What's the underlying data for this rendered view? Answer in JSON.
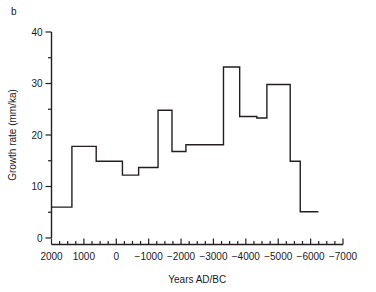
{
  "figure": {
    "panel_label": "b",
    "background_color": "#ffffff",
    "line_color": "#231f20",
    "axis_color": "#231f20"
  },
  "chart_data": {
    "type": "line",
    "style": "step-post",
    "title": "",
    "subtitle": "",
    "xlabel": "Years AD/BC",
    "ylabel": "Growth rate (mm/ka)",
    "xlim": [
      2000,
      -7000
    ],
    "ylim": [
      0,
      40
    ],
    "x_axis_reversed": true,
    "grid": false,
    "legend": null,
    "annotations": [],
    "xticks": [
      2000,
      1000,
      0,
      -1000,
      -2000,
      -3000,
      -4000,
      -5000,
      -6000,
      -7000
    ],
    "xticklabels": [
      "2000",
      "1000",
      "0",
      "−1000",
      "−2000",
      "−3000",
      "−4000",
      "−5000",
      "−6000",
      "−7000"
    ],
    "x_minor_tick_interval": 250,
    "yticks": [
      0,
      10,
      20,
      30,
      40
    ],
    "yticklabels": [
      "0",
      "10",
      "20",
      "30",
      "40"
    ],
    "y_minor_tick_interval": 5,
    "series": [
      {
        "name": "Growth rate",
        "steps": [
          {
            "x_start": 2000,
            "x_end": 1370,
            "value": 6.0
          },
          {
            "x_start": 1370,
            "x_end": 620,
            "value": 17.8
          },
          {
            "x_start": 620,
            "x_end": -190,
            "value": 14.9
          },
          {
            "x_start": -190,
            "x_end": -690,
            "value": 12.2
          },
          {
            "x_start": -690,
            "x_end": -1290,
            "value": 13.7
          },
          {
            "x_start": -1290,
            "x_end": -1720,
            "value": 24.8
          },
          {
            "x_start": -1720,
            "x_end": -2150,
            "value": 16.8
          },
          {
            "x_start": -2150,
            "x_end": -3310,
            "value": 18.1
          },
          {
            "x_start": -3310,
            "x_end": -3810,
            "value": 33.2
          },
          {
            "x_start": -3810,
            "x_end": -4340,
            "value": 23.6
          },
          {
            "x_start": -4340,
            "x_end": -4650,
            "value": 23.3
          },
          {
            "x_start": -4650,
            "x_end": -5370,
            "value": 29.8
          },
          {
            "x_start": -5370,
            "x_end": -5680,
            "value": 14.9
          },
          {
            "x_start": -5680,
            "x_end": -6240,
            "value": 5.1
          }
        ]
      }
    ]
  }
}
